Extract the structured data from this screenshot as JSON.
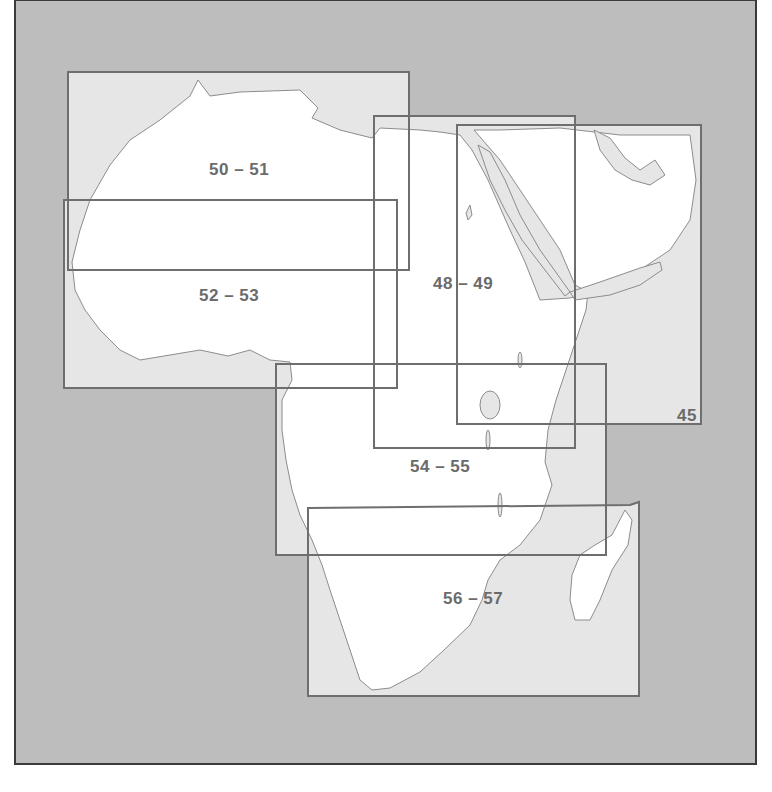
{
  "map": {
    "title": "Africa map sheet index",
    "colors": {
      "frame_bg": "#bdbdbd",
      "sea_in_sheet": "#e6e6e6",
      "land": "#ffffff",
      "box_stroke": "#6e6e6e",
      "coast_stroke": "#8c8c8c",
      "label": "#6b6b6b"
    },
    "sheets": [
      {
        "id": "50-51",
        "label": "50 – 51",
        "box": [
          68,
          72,
          409,
          270
        ]
      },
      {
        "id": "52-53",
        "label": "52 – 53",
        "box": [
          64,
          200,
          397,
          388
        ]
      },
      {
        "id": "48-49",
        "label": "48 – 49",
        "box": [
          374,
          116,
          575,
          448
        ]
      },
      {
        "id": "45",
        "label": "45",
        "box": [
          457,
          125,
          701,
          424
        ]
      },
      {
        "id": "54-55",
        "label": "54 – 55",
        "box": [
          276,
          364,
          606,
          555
        ]
      },
      {
        "id": "56-57",
        "label": "56 – 57",
        "box": [
          308,
          502,
          639,
          696
        ]
      }
    ]
  }
}
